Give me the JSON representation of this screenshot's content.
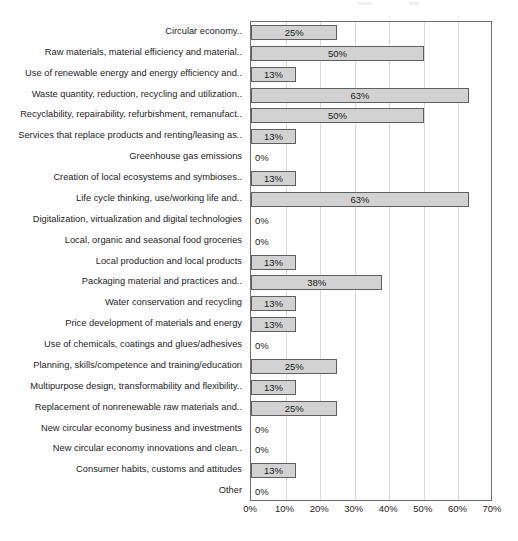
{
  "chart_data": {
    "type": "bar",
    "orientation": "horizontal",
    "title": "",
    "subtitle": "",
    "xlabel": "",
    "ylabel": "",
    "xlim": [
      0,
      70
    ],
    "xtick_labels": [
      "0%",
      "10%",
      "20%",
      "30%",
      "40%",
      "50%",
      "60%",
      "70%"
    ],
    "xtick_values": [
      0,
      10,
      20,
      30,
      40,
      50,
      60,
      70
    ],
    "grid": true,
    "legend": "none",
    "value_label_suffix": "%",
    "categories": [
      "Circular economy..",
      "Raw materials, material efficiency and material..",
      "Use of renewable energy and energy efficiency and..",
      "Waste quantity, reduction, recycling and utilization..",
      "Recyclability, repairability, refurbishment, remanufact..",
      "Services that replace products and renting/leasing as..",
      "Greenhouse gas emissions",
      "Creation of local ecosystems and symbioses..",
      "Life cycle thinking, use/working life and..",
      "Digitalization, virtualization and digital technologies",
      "Local, organic and seasonal food groceries",
      "Local production and local products",
      "Packaging material and practices and..",
      "Water conservation and recycling",
      "Price development of materials and energy",
      "Use of chemicals, coatings and glues/adhesives",
      "Planning, skills/competence and training/education",
      "Multipurpose design, transformability and flexibility..",
      "Replacement of nonrenewable raw materials and..",
      "New circular economy business and investments",
      "New circular economy innovations and clean..",
      "Consumer habits, customs and attitudes",
      "Other"
    ],
    "values": [
      25,
      50,
      13,
      63,
      50,
      13,
      0,
      13,
      63,
      0,
      0,
      13,
      38,
      13,
      13,
      0,
      25,
      13,
      25,
      0,
      0,
      13,
      0
    ],
    "value_labels": [
      "25%",
      "50%",
      "13%",
      "63%",
      "50%",
      "13%",
      "0%",
      "13%",
      "63%",
      "0%",
      "0%",
      "13%",
      "38%",
      "13%",
      "13%",
      "0%",
      "25%",
      "13%",
      "25%",
      "0%",
      "0%",
      "13%",
      "0%"
    ],
    "colors": {
      "bar_fill": "#d2d2d2",
      "bar_border": "#5f5f5f",
      "gridline": "#d9d9d9",
      "axis": "#6e6e6e",
      "text": "#1d1d1d",
      "background": "#ffffff"
    }
  }
}
